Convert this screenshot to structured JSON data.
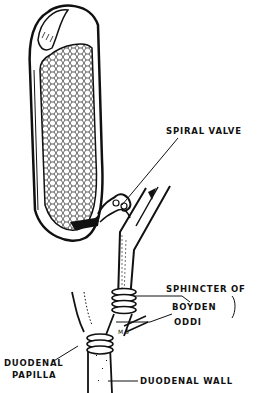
{
  "diagram": {
    "labels": {
      "spiral_valve": "SPIRAL VALVE",
      "sphincter_of": "SPHINCTER OF",
      "boyden": "BOYDEN",
      "oddi": "ODDI",
      "duodenal_papilla_line1": "DUODENAL",
      "duodenal_papilla_line2": "PAPILLA",
      "duodenal_wall": "DUODENAL WALL",
      "initials": "M.S"
    },
    "colors": {
      "ink": "#111111",
      "background": "#ffffff"
    }
  }
}
